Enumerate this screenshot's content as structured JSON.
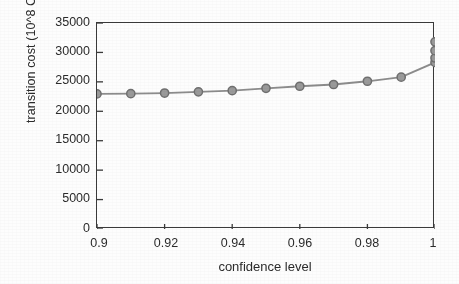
{
  "chart_data": {
    "type": "line",
    "title": "",
    "xlabel": "confidence level",
    "ylabel": "transition cost (10^8  CNY)",
    "xlim": [
      0.9,
      1.0
    ],
    "ylim": [
      0,
      35000
    ],
    "grid": false,
    "legend": null,
    "xticks": [
      0.9,
      0.92,
      0.94,
      0.96,
      0.98,
      1
    ],
    "xtick_labels": [
      "0.9",
      "0.92",
      "0.94",
      "0.96",
      "0.98",
      "1"
    ],
    "yticks": [
      0,
      5000,
      10000,
      15000,
      20000,
      25000,
      30000,
      35000
    ],
    "ytick_labels": [
      "0",
      "5000",
      "10000",
      "15000",
      "20000",
      "25000",
      "30000",
      "35000"
    ],
    "series": [
      {
        "name": "transition cost",
        "marker": "circle",
        "line_color": "#8c8c8c",
        "marker_color": "#9a9a9a",
        "marker_edge_color": "#6f6f6f",
        "x": [
          0.9,
          0.91,
          0.92,
          0.93,
          0.94,
          0.95,
          0.96,
          0.97,
          0.98,
          0.99,
          1.0
        ],
        "values": [
          22950,
          23000,
          23100,
          23300,
          23500,
          23900,
          24250,
          24550,
          25100,
          25800,
          28300
        ]
      },
      {
        "name": "transition cost (tail cluster at confidence level 1)",
        "marker": "circle",
        "line_color": "#8c8c8c",
        "marker_color": "#9a9a9a",
        "marker_edge_color": "#6f6f6f",
        "x": [
          1.0,
          1.0,
          1.0
        ],
        "values": [
          29050,
          30300,
          31800
        ]
      }
    ],
    "annotations": []
  },
  "axes": {
    "frame_color": "#3a3a3a",
    "tick_color": "#3a3a3a",
    "text_color": "#2b2b2b",
    "background": "#fdfdfd"
  }
}
